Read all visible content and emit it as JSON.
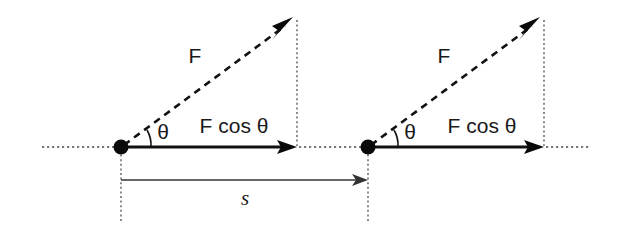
{
  "diagram": {
    "background_color": "#ffffff",
    "stroke_color": "#111111",
    "dotted_color": "#4a4a4a",
    "figures": [
      {
        "name": "initial-position",
        "force_label": "F",
        "component_label": "F cos θ",
        "angle_label": "θ",
        "angle_degrees": 28
      },
      {
        "name": "final-position",
        "force_label": "F",
        "component_label": "F cos θ",
        "angle_label": "θ",
        "angle_degrees": 28
      }
    ],
    "displacement": {
      "label": "s",
      "description": "displacement between initial and final particle positions"
    }
  }
}
